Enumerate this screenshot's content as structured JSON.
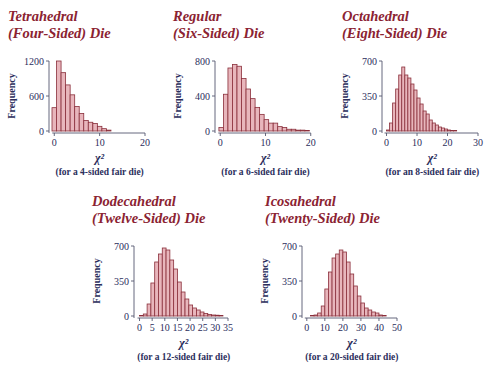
{
  "colors": {
    "title": "#8b2332",
    "bar_fill": "#e8b6bc",
    "bar_stroke": "#8a2f3b",
    "axis_text": "#2b2e5c",
    "axis_line": "#55586f"
  },
  "chart_data": [
    {
      "type": "bar",
      "title": "Tetrahedral (Four-Sided) Die",
      "title_lines": [
        "Tetrahedral",
        "(Four-Sided) Die"
      ],
      "xlabel": "χ²",
      "ylabel": "Frequency",
      "note": "(for a 4-sided fair die)",
      "xticks": [
        0,
        10,
        20
      ],
      "yticks": [
        0,
        600,
        1200
      ],
      "xlim": [
        -0.5,
        20
      ],
      "ylim": [
        0,
        1200
      ],
      "bin_width": 1,
      "bin_start": -0.5,
      "values": [
        400,
        1200,
        1000,
        790,
        620,
        420,
        300,
        180,
        150,
        130,
        80,
        40,
        15
      ]
    },
    {
      "type": "bar",
      "title": "Regular (Six-Sided) Die",
      "title_lines": [
        "Regular",
        "(Six-Sided) Die"
      ],
      "xlabel": "χ²",
      "ylabel": "Frequency",
      "note": "(for a 6-sided fair die)",
      "xticks": [
        0,
        10,
        20
      ],
      "yticks": [
        0,
        400,
        800
      ],
      "xlim": [
        -0.5,
        20.5
      ],
      "ylim": [
        0,
        800
      ],
      "bin_width": 1,
      "bin_start": -0.3,
      "values": [
        40,
        420,
        720,
        760,
        740,
        600,
        480,
        370,
        270,
        190,
        130,
        90,
        90,
        50,
        40,
        20,
        20,
        10,
        10,
        5
      ]
    },
    {
      "type": "bar",
      "title": "Octahedral (Eight-Sided) Die",
      "title_lines": [
        "Octahedral",
        "(Eight-Sided) Die"
      ],
      "xlabel": "χ²",
      "ylabel": "Frequency",
      "note": "(for an 8-sided fair die)",
      "xticks": [
        0,
        10,
        20,
        30
      ],
      "yticks": [
        0,
        350,
        700
      ],
      "xlim": [
        -0.5,
        30
      ],
      "ylim": [
        0,
        700
      ],
      "bin_width": 1,
      "bin_start": 0,
      "values": [
        10,
        80,
        280,
        420,
        560,
        640,
        560,
        530,
        470,
        410,
        330,
        270,
        200,
        170,
        110,
        80,
        60,
        40,
        30,
        20,
        10,
        5,
        5
      ]
    },
    {
      "type": "bar",
      "title": "Dodecahedral (Twelve-Sided) Die",
      "title_lines": [
        "Dodecahedral",
        "(Twelve-Sided) Die"
      ],
      "xlabel": "χ²",
      "ylabel": "Frequency",
      "note": "(for a 12-sided fair die)",
      "xticks": [
        0,
        5,
        10,
        15,
        20,
        25,
        30,
        35
      ],
      "yticks": [
        0,
        350,
        700
      ],
      "xlim": [
        -1,
        35
      ],
      "ylim": [
        0,
        700
      ],
      "bin_width": 1.5,
      "bin_start": 0,
      "values": [
        5,
        20,
        120,
        330,
        540,
        620,
        680,
        660,
        560,
        470,
        340,
        240,
        170,
        110,
        80,
        60,
        40,
        25,
        15,
        10,
        8,
        5
      ]
    },
    {
      "type": "bar",
      "title": "Icosahedral (Twenty-Sided) Die",
      "title_lines": [
        "Icosahedral",
        "(Twenty-Sided) Die"
      ],
      "xlabel": "χ²",
      "ylabel": "Frequency",
      "note": "(for a 20-sided fair die)",
      "xticks": [
        0,
        10,
        20,
        30,
        40,
        50
      ],
      "yticks": [
        0,
        350,
        700
      ],
      "xlim": [
        -1,
        50
      ],
      "ylim": [
        0,
        700
      ],
      "bin_width": 2,
      "bin_start": 0,
      "values": [
        0,
        5,
        10,
        30,
        100,
        270,
        440,
        580,
        620,
        660,
        640,
        540,
        420,
        300,
        200,
        130,
        80,
        60,
        40,
        30,
        10,
        5
      ]
    }
  ]
}
